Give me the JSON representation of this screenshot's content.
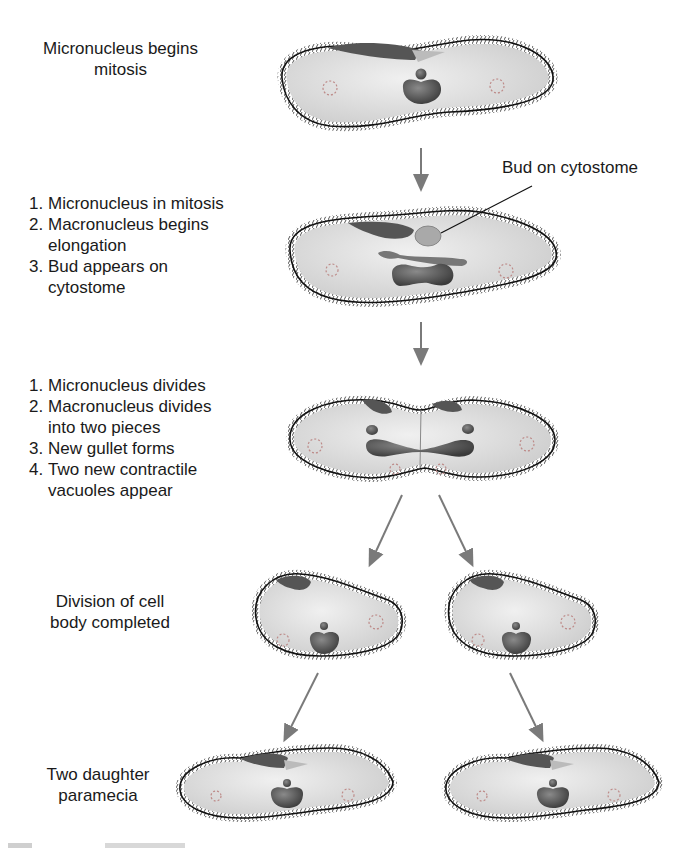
{
  "stages": [
    {
      "id": "stage1",
      "label": "Micronucleus begins mitosis",
      "lines": [
        "Micronucleus begins",
        "mitosis"
      ]
    },
    {
      "id": "stage2",
      "steps": [
        {
          "num": "1.",
          "lines": [
            "Micronucleus in mitosis"
          ]
        },
        {
          "num": "2.",
          "lines": [
            "Macronucleus begins",
            "elongation"
          ]
        },
        {
          "num": "3.",
          "lines": [
            "Bud appears on",
            "cytostome"
          ]
        }
      ]
    },
    {
      "id": "stage3",
      "steps": [
        {
          "num": "1.",
          "lines": [
            "Micronucleus divides"
          ]
        },
        {
          "num": "2.",
          "lines": [
            "Macronucleus divides",
            "into two pieces"
          ]
        },
        {
          "num": "3.",
          "lines": [
            "New gullet forms"
          ]
        },
        {
          "num": "4.",
          "lines": [
            "Two new contractile",
            "vacuoles appear"
          ]
        }
      ]
    },
    {
      "id": "stage4",
      "lines": [
        "Division of cell",
        "body completed"
      ]
    },
    {
      "id": "stage5",
      "lines": [
        "Two daughter",
        "paramecia"
      ]
    }
  ],
  "callouts": {
    "bud": "Bud on cytostome"
  },
  "colors": {
    "arrow": "#7a7a7a",
    "cell_fill": "#d9d9d9",
    "cell_outline": "#111111",
    "nucleus": "#5a5a5a",
    "cilia": "#444444"
  }
}
